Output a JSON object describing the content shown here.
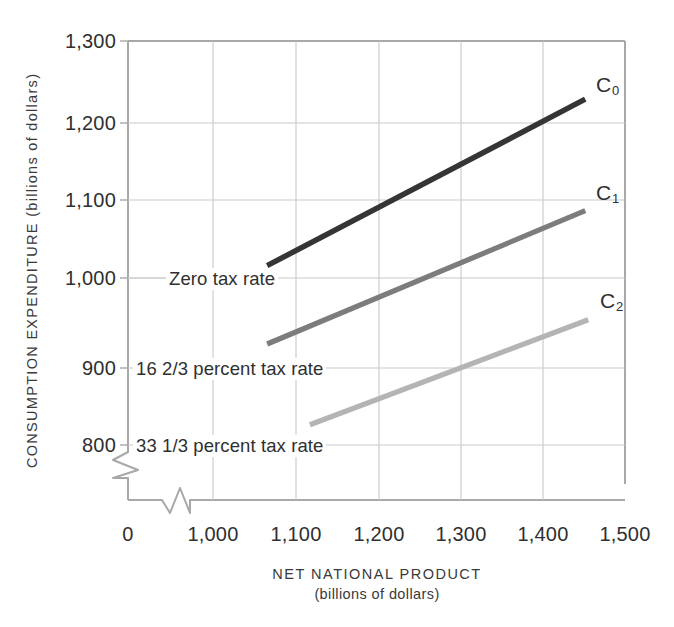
{
  "chart_data": {
    "type": "line",
    "title": "",
    "xlabel": "NET NATIONAL PRODUCT",
    "xlabel_sub": "(billions of dollars)",
    "ylabel": "CONSUMPTION EXPENDITURE (billions of dollars)",
    "xlim": [
      1000,
      1500
    ],
    "ylim": [
      800,
      1300
    ],
    "x_ticks": [
      "0",
      "1,000",
      "1,100",
      "1,200",
      "1,300",
      "1,400",
      "1,500"
    ],
    "y_ticks": [
      "1,300",
      "1,200",
      "1,100",
      "1,000",
      "900",
      "800"
    ],
    "grid": true,
    "axis_break_x": true,
    "axis_break_y": true,
    "legend_position": "inline-right-of-line-ends",
    "series": [
      {
        "name": "C_0",
        "label": "C",
        "label_sub": "0",
        "annotation": "Zero tax rate",
        "color": "#353535",
        "x": [
          1140,
          1460
        ],
        "y": [
          1022,
          1228
        ]
      },
      {
        "name": "C_1",
        "label": "C",
        "label_sub": "1",
        "annotation": "16 2/3 percent tax rate",
        "color": "#7c7c7c",
        "x": [
          1140,
          1460
        ],
        "y": [
          925,
          1090
        ]
      },
      {
        "name": "C_2",
        "label": "C",
        "label_sub": "2",
        "annotation": "33 1/3 percent tax rate",
        "color": "#b4b4b4",
        "x": [
          1183,
          1463
        ],
        "y": [
          825,
          955
        ]
      }
    ]
  },
  "axes": {
    "y_title": "CONSUMPTION EXPENDITURE (billions of dollars)",
    "x_title": "NET NATIONAL PRODUCT",
    "x_subtitle": "(billions of dollars)"
  },
  "yticks": {
    "t0": "1,300",
    "t1": "1,200",
    "t2": "1,100",
    "t3": "1,000",
    "t4": "900",
    "t5": "800"
  },
  "xticks": {
    "t0": "0",
    "t1": "1,000",
    "t2": "1,100",
    "t3": "1,200",
    "t4": "1,300",
    "t5": "1,400",
    "t6": "1,500"
  },
  "annotations": {
    "a0": "Zero tax rate",
    "a1": "16 2/3 percent tax rate",
    "a2": "33 1/3 percent tax rate"
  },
  "curve_labels": {
    "c0": "C",
    "c0_sub": "0",
    "c1": "C",
    "c1_sub": "1",
    "c2": "C",
    "c2_sub": "2"
  },
  "colors": {
    "c0": "#353535",
    "c1": "#7c7c7c",
    "c2": "#b4b4b4",
    "grid": "#c9c9c9",
    "frame": "#a8a8a8",
    "text": "#2f2f2f"
  }
}
